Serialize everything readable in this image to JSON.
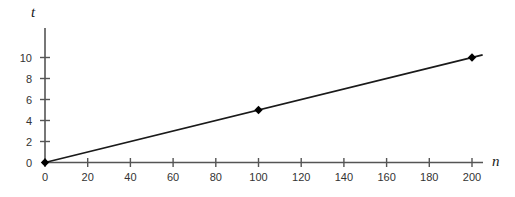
{
  "chart_data": {
    "type": "line",
    "title": "",
    "xlabel": "n",
    "ylabel": "t",
    "xlim": [
      0,
      207
    ],
    "ylim": [
      0,
      11.6
    ],
    "grid": false,
    "legend": "none",
    "xticks": [
      0,
      20,
      40,
      60,
      80,
      100,
      120,
      140,
      160,
      180,
      200
    ],
    "xtick_labels": [
      "0",
      "20",
      "40",
      "60",
      "80",
      "100",
      "120",
      "140",
      "160",
      "180",
      "200"
    ],
    "yticks": [
      0,
      2,
      4,
      6,
      8,
      10
    ],
    "ytick_labels": [
      "0",
      "2",
      "4",
      "6",
      "8",
      "10"
    ],
    "series": [
      {
        "name": "t versus n",
        "x": [
          0,
          205
        ],
        "y": [
          0,
          10.25
        ],
        "slope": 0.05,
        "intercept": 0,
        "color": "#1a1a1a"
      }
    ],
    "markers": [
      {
        "label": "origin-point",
        "x": 0,
        "y": 0
      },
      {
        "label": "mid-point",
        "x": 100,
        "y": 5
      },
      {
        "label": "end-point",
        "x": 200,
        "y": 10
      }
    ],
    "colors": {
      "axis": "#555555",
      "line": "#1a1a1a",
      "marker": "#000000",
      "text": "#333333",
      "background": "#ffffff"
    }
  }
}
